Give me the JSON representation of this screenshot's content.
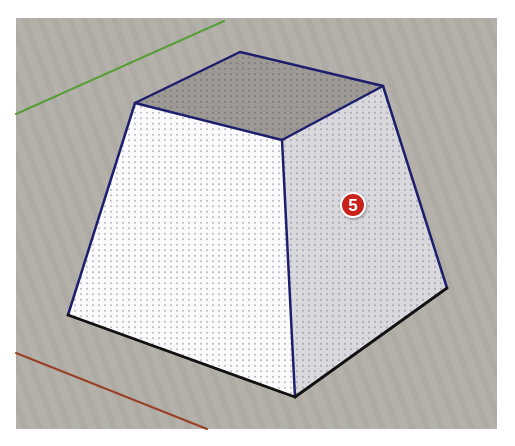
{
  "scene": {
    "description": "SketchUp-style 3D viewport showing a truncated square pyramid (frustum) with dotted face texture",
    "viewport": {
      "x": 16,
      "y": 18,
      "width": 481,
      "height": 411,
      "background": "#b4b1aa"
    },
    "axes": {
      "green": {
        "color": "#5a9e3a",
        "x1": 16,
        "y1": 114,
        "x2": 224,
        "y2": 21
      },
      "red": {
        "color": "#9a3f22",
        "x1": 16,
        "y1": 353,
        "x2": 207,
        "y2": 429
      }
    },
    "vertices": {
      "top_back": [
        240,
        52
      ],
      "top_left": [
        135,
        103
      ],
      "top_front": [
        282,
        140
      ],
      "top_right": [
        383,
        86
      ],
      "bottom_left": [
        68,
        315
      ],
      "bottom_front": [
        295,
        397
      ],
      "bottom_right": [
        447,
        288
      ]
    },
    "faces": {
      "top": {
        "color": "#9d9994"
      },
      "left": {
        "color": "#fbfbfd"
      },
      "right": {
        "color": "#d9d8dc"
      }
    },
    "edge_colors": {
      "upper": "#1e1e6e",
      "bottom": "#111111"
    }
  },
  "callout": {
    "label": "5",
    "cx": 353,
    "cy": 205,
    "r": 12,
    "fill": "#c8201f",
    "border": "#ffffff"
  }
}
